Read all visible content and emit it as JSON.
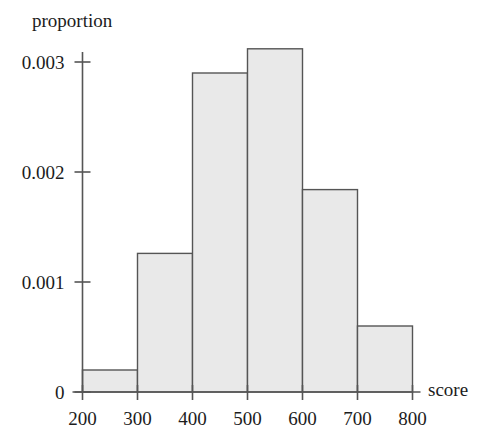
{
  "chart_data": {
    "type": "bar",
    "title": "",
    "subtitle": "",
    "xlabel": "score",
    "ylabel": "proportion",
    "grid": false,
    "legend": false,
    "bin_edges": [
      200,
      300,
      400,
      500,
      600,
      700,
      800
    ],
    "categories": [
      "200-300",
      "300-400",
      "400-500",
      "500-600",
      "600-700",
      "700-800"
    ],
    "values": [
      0.0002,
      0.00126,
      0.0029,
      0.00312,
      0.00184,
      0.0006
    ],
    "xlim": [
      200,
      800
    ],
    "ylim": [
      0,
      0.0032
    ],
    "xticks": [
      200,
      300,
      400,
      500,
      600,
      700,
      800
    ],
    "xtick_labels": [
      "200",
      "300",
      "400",
      "500",
      "600",
      "700",
      "800"
    ],
    "yticks": [
      0,
      0.001,
      0.002,
      0.003
    ],
    "ytick_labels": [
      "0",
      "0.001",
      "0.002",
      "0.003"
    ],
    "bar_fill": "#e9e9e9",
    "bar_stroke": "#555555",
    "axis_color": "#555555"
  },
  "axes": {
    "y_title": "proportion",
    "x_title": "score"
  },
  "y_ticks": [
    {
      "label": "0.003",
      "value": 0.003
    },
    {
      "label": "0.002",
      "value": 0.002
    },
    {
      "label": "0.001",
      "value": 0.001
    },
    {
      "label": "0",
      "value": 0
    }
  ],
  "x_ticks": [
    {
      "label": "200",
      "value": 200
    },
    {
      "label": "300",
      "value": 300
    },
    {
      "label": "400",
      "value": 400
    },
    {
      "label": "500",
      "value": 500
    },
    {
      "label": "600",
      "value": 600
    },
    {
      "label": "700",
      "value": 700
    },
    {
      "label": "800",
      "value": 800
    }
  ]
}
